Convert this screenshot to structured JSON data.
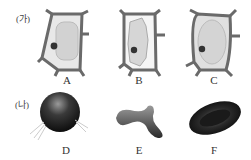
{
  "panels": {
    "ga": {
      "label": "(가)"
    },
    "na": {
      "label": "(나)"
    }
  },
  "cells": {
    "A": "A",
    "B": "B",
    "C": "C",
    "D": "D",
    "E": "E",
    "F": "F"
  }
}
